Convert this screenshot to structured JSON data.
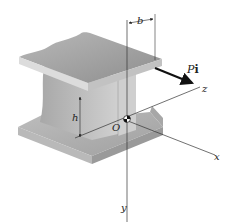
{
  "figure": {
    "labels": {
      "b": "b",
      "h": "h",
      "origin": "O",
      "load_P": "P",
      "load_i": "i",
      "axis_x": "x",
      "axis_y": "y",
      "axis_z": "z"
    },
    "colors": {
      "flange_top": "#9e9e9e",
      "flange_edge": "#d6d6d6",
      "web": "#c4c4c4",
      "web_side": "#b0b0b0",
      "line": "#333333",
      "arrow": "#111111"
    }
  }
}
